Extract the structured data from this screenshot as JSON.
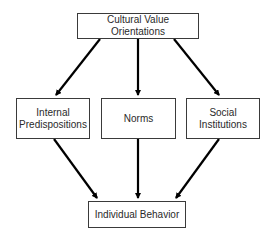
{
  "diagram": {
    "type": "flowchart",
    "nodes": {
      "top": {
        "label": "Cultural Value Orientations"
      },
      "left": {
        "line1": "Internal",
        "line2": "Predispositions"
      },
      "middle": {
        "label": "Norms"
      },
      "right": {
        "line1": "Social",
        "line2": "Institutions"
      },
      "bottom": {
        "label": "Individual Behavior"
      }
    },
    "edges": [
      {
        "from": "Cultural Value Orientations",
        "to": "Internal Predispositions"
      },
      {
        "from": "Cultural Value Orientations",
        "to": "Norms"
      },
      {
        "from": "Cultural Value Orientations",
        "to": "Social Institutions"
      },
      {
        "from": "Internal Predispositions",
        "to": "Individual Behavior"
      },
      {
        "from": "Norms",
        "to": "Individual Behavior"
      },
      {
        "from": "Social Institutions",
        "to": "Individual Behavior"
      }
    ],
    "colors": {
      "arrow": "#000000",
      "border": "#3a3a3a",
      "text": "#2a2a2a",
      "background": "#ffffff"
    }
  }
}
